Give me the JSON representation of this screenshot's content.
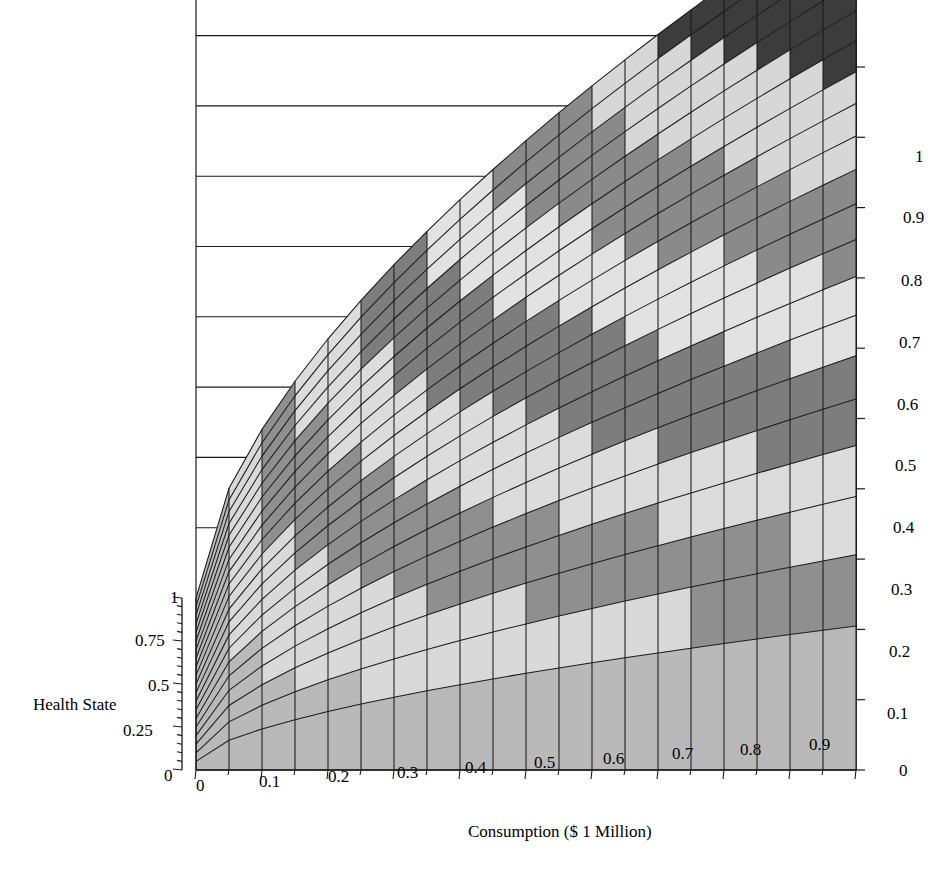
{
  "figure": {
    "title": "Attribute Dominance Utility Surface",
    "caption": "",
    "background": "#ffffff",
    "line_color": "#1a1a1a"
  },
  "axes": {
    "x": {
      "title": "Consumption ($ 1 Million)",
      "ticks": [
        "0",
        "0.1",
        "0.2",
        "0.3",
        "0.4",
        "0.5",
        "0.6",
        "0.7",
        "0.8",
        "0.9"
      ],
      "range": [
        0,
        1
      ]
    },
    "y": {
      "title": "Health State",
      "ticks": [
        "1",
        "0.75",
        "0.5",
        "0.25",
        "0"
      ],
      "range": [
        0,
        1
      ]
    },
    "z": {
      "title": "",
      "ticks": [
        "1",
        "0.9",
        "0.8",
        "0.7",
        "0.6",
        "0.5",
        "0.4",
        "0.3",
        "0.2",
        "0.1",
        "0"
      ],
      "range": [
        0,
        1
      ]
    }
  },
  "chart_data": {
    "type": "surface",
    "title": "Attribute Dominance Utility Surface",
    "xlabel": "Consumption ($ 1 Million)",
    "ylabel": "Health State",
    "zlabel": "Utility",
    "xlim": [
      0,
      1
    ],
    "ylim": [
      0,
      1
    ],
    "zlim": [
      0,
      1
    ],
    "grid": true,
    "legend": "none",
    "mesh": {
      "nx": 20,
      "ny": 20
    },
    "surface_model": "z = (x^0.62) * (y^0.55)",
    "shading": {
      "type": "contour-bands",
      "band_count": 10,
      "band_edges": [
        0,
        0.1,
        0.2,
        0.3,
        0.4,
        0.5,
        0.6,
        0.7,
        0.8,
        0.9,
        1.0
      ],
      "band_colors": [
        "#b9b9b9",
        "#d9d9d9",
        "#8f8f8f",
        "#dcdcdc",
        "#7d7d7d",
        "#e2e2e2",
        "#8a8a8a",
        "#d7d7d7",
        "#3c3c3c",
        "#bdbdbd"
      ],
      "mesh_line_color": "#242424",
      "side_wall_color": "#b2b2b2"
    },
    "view": {
      "apex_px": [
        712,
        67
      ],
      "front_left_px": [
        196,
        770
      ],
      "front_right_px": [
        856,
        770
      ],
      "back_left_px": [
        196,
        598
      ]
    },
    "sampled_points": [
      {
        "x": 0.0,
        "y": 0.0,
        "z": 0.0
      },
      {
        "x": 0.0,
        "y": 1.0,
        "z": 0.0
      },
      {
        "x": 1.0,
        "y": 0.0,
        "z": 0.0
      },
      {
        "x": 1.0,
        "y": 1.0,
        "z": 1.0
      },
      {
        "x": 0.5,
        "y": 0.5,
        "z": 0.44
      },
      {
        "x": 0.25,
        "y": 1.0,
        "z": 0.42
      },
      {
        "x": 1.0,
        "y": 0.25,
        "z": 0.47
      },
      {
        "x": 0.75,
        "y": 0.75,
        "z": 0.72
      }
    ]
  },
  "tick_positions": {
    "x": [
      {
        "label": "0",
        "left": 196,
        "top": 776
      },
      {
        "label": "0.1",
        "left": 259,
        "top": 772
      },
      {
        "label": "0.2",
        "left": 328,
        "top": 767
      },
      {
        "label": "0.3",
        "left": 397,
        "top": 763
      },
      {
        "label": "0.4",
        "left": 465,
        "top": 758
      },
      {
        "label": "0.5",
        "left": 534,
        "top": 753
      },
      {
        "label": "0.6",
        "left": 603,
        "top": 749
      },
      {
        "label": "0.7",
        "left": 672,
        "top": 744
      },
      {
        "label": "0.8",
        "left": 740,
        "top": 740
      },
      {
        "label": "0.9",
        "left": 809,
        "top": 735
      }
    ],
    "y": [
      {
        "label": "1",
        "left": 170,
        "top": 588
      },
      {
        "label": "0.75",
        "left": 135,
        "top": 631
      },
      {
        "label": "0.5",
        "left": 148,
        "top": 676
      },
      {
        "label": "0.25",
        "left": 123,
        "top": 721
      },
      {
        "label": "0",
        "left": 164,
        "top": 766
      }
    ],
    "z": [
      {
        "label": "1",
        "left": 915,
        "top": 147
      },
      {
        "label": "0.9",
        "left": 903,
        "top": 208
      },
      {
        "label": "0.8",
        "left": 901,
        "top": 271
      },
      {
        "label": "0.7",
        "left": 899,
        "top": 333
      },
      {
        "label": "0.6",
        "left": 897,
        "top": 395
      },
      {
        "label": "0.5",
        "left": 895,
        "top": 456
      },
      {
        "label": "0.4",
        "left": 893,
        "top": 518
      },
      {
        "label": "0.3",
        "left": 891,
        "top": 580
      },
      {
        "label": "0.2",
        "left": 889,
        "top": 642
      },
      {
        "label": "0.1",
        "left": 887,
        "top": 704
      },
      {
        "label": "0",
        "left": 899,
        "top": 761
      }
    ]
  }
}
